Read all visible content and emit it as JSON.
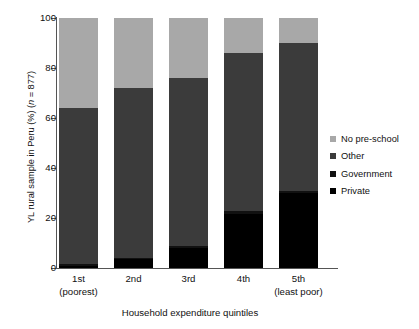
{
  "axes": {
    "y_title_prefix": "YL rural sample in Peru (%) (",
    "y_title_italic": "n",
    "y_title_suffix": " = 877)",
    "y_title_full": "YL rural sample in Peru (%) (n = 877)",
    "x_title": "Household expenditure quintiles",
    "y_ticks": [
      "0",
      "20",
      "40",
      "60",
      "80",
      "100"
    ],
    "x_tick_labels": [
      {
        "main": "1st",
        "sub": "(poorest)"
      },
      {
        "main": "2nd",
        "sub": ""
      },
      {
        "main": "3rd",
        "sub": ""
      },
      {
        "main": "4th",
        "sub": ""
      },
      {
        "main": "5th",
        "sub": "(least poor)"
      }
    ]
  },
  "legend": {
    "items": [
      {
        "label": "No pre-school",
        "color": "#a8a8a8"
      },
      {
        "label": "Other",
        "color": "#3b3b3b"
      },
      {
        "label": "Government",
        "color": "#111111"
      },
      {
        "label": "Private",
        "color": "#000000"
      }
    ]
  },
  "chart_data": {
    "type": "bar",
    "subtype": "stacked-bar-100pct",
    "title": "",
    "xlabel": "Household expenditure quintiles",
    "ylabel": "YL rural sample in Peru (%) (n = 877)",
    "ylim": [
      0,
      100
    ],
    "yticks": [
      0,
      20,
      40,
      60,
      80,
      100
    ],
    "grid": false,
    "legend_position": "right",
    "sample_size": 877,
    "categories": [
      "1st (poorest)",
      "2nd",
      "3rd",
      "4th",
      "5th (least poor)"
    ],
    "series": [
      {
        "name": "Private",
        "color": "#000000",
        "values": [
          1.0,
          3.5,
          8.0,
          21.5,
          30.0
        ]
      },
      {
        "name": "Government",
        "color": "#111111",
        "values": [
          0.5,
          0.5,
          1.0,
          1.5,
          1.0
        ]
      },
      {
        "name": "Other",
        "color": "#3b3b3b",
        "values": [
          62.5,
          68.0,
          67.0,
          63.0,
          59.0
        ]
      },
      {
        "name": "No pre-school",
        "color": "#a8a8a8",
        "values": [
          36.0,
          28.0,
          24.0,
          14.0,
          10.0
        ]
      }
    ],
    "stack_order_bottom_to_top": [
      "Private",
      "Government",
      "Other",
      "No pre-school"
    ],
    "cumulative_tops": {
      "1st": {
        "Private": 1.0,
        "Government": 1.5,
        "Other": 64.0,
        "No pre-school": 100.0
      },
      "2nd": {
        "Private": 3.5,
        "Government": 4.0,
        "Other": 72.0,
        "No pre-school": 100.0
      },
      "3rd": {
        "Private": 8.0,
        "Government": 9.0,
        "Other": 76.0,
        "No pre-school": 100.0
      },
      "4th": {
        "Private": 21.5,
        "Government": 23.0,
        "Other": 86.0,
        "No pre-school": 100.0
      },
      "5th": {
        "Private": 30.0,
        "Government": 31.0,
        "Other": 90.0,
        "No pre-school": 100.0
      }
    }
  }
}
